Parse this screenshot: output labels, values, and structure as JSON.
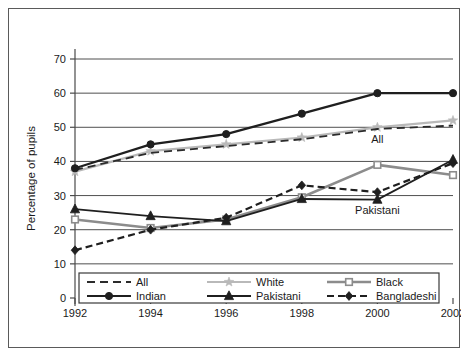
{
  "chart_data": {
    "type": "line",
    "title": "",
    "xlabel": "",
    "ylabel": "Percentage of pupils",
    "categories": [
      "1992",
      "1994",
      "1996",
      "1998",
      "2000",
      "2002"
    ],
    "x": [
      1992,
      1994,
      1996,
      1998,
      2000,
      2002
    ],
    "xlim": [
      1992,
      2002
    ],
    "ylim": [
      0,
      70
    ],
    "yticks": [
      "0",
      "10",
      "20",
      "30",
      "40",
      "50",
      "60",
      "70"
    ],
    "ytick_values": [
      0,
      10,
      20,
      30,
      40,
      50,
      60,
      70
    ],
    "grid": "horizontal",
    "legend_position": "bottom-inside",
    "series": [
      {
        "name": "All",
        "values": [
          37.5,
          42.5,
          44.5,
          46.5,
          49.5,
          50.5
        ],
        "color": "#2b2b2b",
        "marker": "none",
        "dash": "8,5",
        "width": 1.8
      },
      {
        "name": "White",
        "values": [
          37,
          43,
          45,
          47,
          50,
          52
        ],
        "color": "#b9b9b9",
        "marker": "star",
        "dash": "none",
        "width": 2.2
      },
      {
        "name": "Black",
        "values": [
          23,
          20.5,
          23,
          29.5,
          39,
          36
        ],
        "color": "#8c8c8c",
        "marker": "square",
        "dash": "none",
        "width": 2.6
      },
      {
        "name": "Indian",
        "values": [
          38,
          45,
          48,
          54,
          60,
          60
        ],
        "color": "#1f1f1f",
        "marker": "circle",
        "dash": "none",
        "width": 2.2
      },
      {
        "name": "Pakistani",
        "values": [
          26,
          24,
          22.5,
          29,
          28.8,
          40.5
        ],
        "color": "#1f1f1f",
        "marker": "triangle",
        "dash": "none",
        "width": 1.8
      },
      {
        "name": "Bangladeshi",
        "values": [
          14,
          20,
          23.5,
          33,
          31,
          39.5
        ],
        "color": "#1f1f1f",
        "marker": "diamond",
        "dash": "7,4",
        "width": 2.2
      }
    ],
    "annotations": [
      {
        "text": "All",
        "x": 2000,
        "y": 45.3
      },
      {
        "text": "Pakistani",
        "x": 2000,
        "y": 24.5
      }
    ]
  },
  "legend": {
    "entries": [
      {
        "label": "All"
      },
      {
        "label": "White"
      },
      {
        "label": "Black"
      },
      {
        "label": "Indian"
      },
      {
        "label": "Pakistani"
      },
      {
        "label": "Bangladeshi"
      }
    ]
  },
  "colors": {
    "frame": "#5a5a5a",
    "axis": "#4a4a4a",
    "grid": "#4f4f4f",
    "background": "#ffffff"
  }
}
